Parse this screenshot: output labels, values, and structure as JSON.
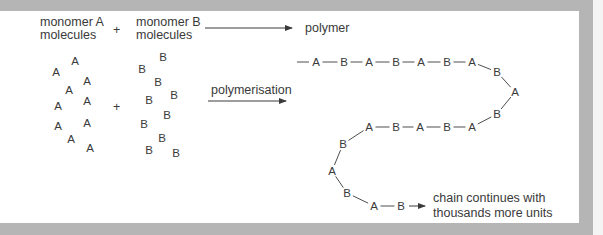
{
  "labels": {
    "monomer_a_line1": "monomer A",
    "monomer_a_line2": "molecules",
    "plus": "+",
    "monomer_b_line1": "monomer B",
    "monomer_b_line2": "molecules",
    "polymer": "polymer",
    "polymerisation": "polymerisation",
    "chain_note_line1": "chain continues with",
    "chain_note_line2": "thousands more units"
  },
  "monomer_a": {
    "symbol": "A",
    "count": 10,
    "positions": [
      [
        75,
        61
      ],
      [
        56,
        72
      ],
      [
        87,
        81
      ],
      [
        69,
        90
      ],
      [
        87,
        101
      ],
      [
        58,
        106
      ],
      [
        87,
        123
      ],
      [
        58,
        126
      ],
      [
        71,
        139
      ],
      [
        90,
        148
      ]
    ]
  },
  "monomer_b": {
    "symbol": "B",
    "count": 10,
    "positions": [
      [
        163,
        57
      ],
      [
        142,
        69
      ],
      [
        158,
        82
      ],
      [
        174,
        95
      ],
      [
        149,
        100
      ],
      [
        167,
        115
      ],
      [
        144,
        124
      ],
      [
        162,
        138
      ],
      [
        149,
        150
      ],
      [
        176,
        153
      ]
    ]
  },
  "polymer_chain": {
    "units": [
      {
        "s": "A",
        "x": 316,
        "y": 62
      },
      {
        "s": "B",
        "x": 344,
        "y": 62
      },
      {
        "s": "A",
        "x": 369,
        "y": 62
      },
      {
        "s": "B",
        "x": 396,
        "y": 62
      },
      {
        "s": "A",
        "x": 421,
        "y": 62
      },
      {
        "s": "B",
        "x": 447,
        "y": 62
      },
      {
        "s": "A",
        "x": 472,
        "y": 62
      },
      {
        "s": "B",
        "x": 497,
        "y": 72
      },
      {
        "s": "A",
        "x": 515,
        "y": 92
      },
      {
        "s": "B",
        "x": 497,
        "y": 114
      },
      {
        "s": "A",
        "x": 472,
        "y": 127
      },
      {
        "s": "B",
        "x": 447,
        "y": 127
      },
      {
        "s": "A",
        "x": 420,
        "y": 127
      },
      {
        "s": "B",
        "x": 396,
        "y": 127
      },
      {
        "s": "A",
        "x": 369,
        "y": 127
      },
      {
        "s": "B",
        "x": 343,
        "y": 144
      },
      {
        "s": "A",
        "x": 332,
        "y": 171
      },
      {
        "s": "B",
        "x": 347,
        "y": 193
      },
      {
        "s": "A",
        "x": 374,
        "y": 206
      },
      {
        "s": "B",
        "x": 401,
        "y": 206
      }
    ]
  },
  "colors": {
    "text": "#3a3a3a",
    "frame": "#b5b5b5",
    "background": "#ffffff"
  }
}
